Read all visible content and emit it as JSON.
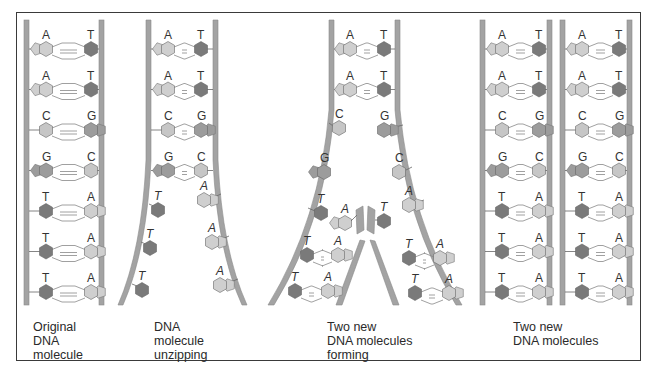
{
  "diagram": {
    "colors": {
      "strand": "#a3a3a3",
      "strand_edge": "#8a8a8a",
      "adenine": "#cfcfcf",
      "thymine": "#7a7a7a",
      "cytosine": "#c6c6c6",
      "guanine": "#9c9c9c",
      "border": "#3a3a3a"
    },
    "panels": [
      {
        "id": "original",
        "caption": [
          "Original",
          "DNA",
          "molecule"
        ],
        "pairs": [
          [
            "A",
            "T"
          ],
          [
            "A",
            "T"
          ],
          [
            "C",
            "G"
          ],
          [
            "G",
            "C"
          ],
          [
            "T",
            "A"
          ],
          [
            "T",
            "A"
          ],
          [
            "T",
            "A"
          ]
        ]
      },
      {
        "id": "unzipping",
        "caption": [
          "DNA",
          "molecule",
          "unzipping"
        ],
        "paired": [
          [
            "A",
            "T"
          ],
          [
            "A",
            "T"
          ],
          [
            "C",
            "G"
          ],
          [
            "G",
            "C"
          ]
        ],
        "unpaired_left": [
          "T",
          "T",
          "T"
        ],
        "unpaired_right": [
          "A",
          "A",
          "A"
        ]
      },
      {
        "id": "forming",
        "caption": [
          "Two new",
          "DNA molecules",
          "forming"
        ],
        "paired": [
          [
            "A",
            "T"
          ],
          [
            "A",
            "T"
          ]
        ],
        "separated_left": [
          "C",
          "G",
          "T"
        ],
        "separated_right": [
          "G",
          "C",
          "A"
        ],
        "incoming_left": "A",
        "incoming_right": "T",
        "new_pairs_left": [
          [
            "T",
            "A"
          ],
          [
            "T",
            "A"
          ]
        ],
        "new_pairs_right": [
          [
            "T",
            "A"
          ],
          [
            "T",
            "A"
          ]
        ]
      },
      {
        "id": "new_molecules",
        "caption": [
          "Two new",
          "DNA molecules"
        ],
        "molecules": [
          [
            [
              "A",
              "T"
            ],
            [
              "A",
              "T"
            ],
            [
              "C",
              "G"
            ],
            [
              "G",
              "C"
            ],
            [
              "T",
              "A"
            ],
            [
              "T",
              "A"
            ],
            [
              "T",
              "A"
            ]
          ],
          [
            [
              "A",
              "T"
            ],
            [
              "A",
              "T"
            ],
            [
              "C",
              "G"
            ],
            [
              "G",
              "C"
            ],
            [
              "T",
              "A"
            ],
            [
              "T",
              "A"
            ],
            [
              "T",
              "A"
            ]
          ]
        ]
      }
    ]
  }
}
